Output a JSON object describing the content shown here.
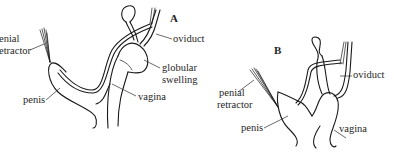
{
  "figure": {
    "panels": [
      {
        "id": "A",
        "letter": "A",
        "labels": {
          "penial_retractor_line1": "enial",
          "penial_retractor_line2": "etractor",
          "oviduct": "oviduct",
          "globular_swelling_line1": "globular",
          "globular_swelling_line2": "swelling",
          "vagina": "vagina",
          "penis": "penis"
        }
      },
      {
        "id": "B",
        "letter": "B",
        "labels": {
          "penial_retractor_line1": "penial",
          "penial_retractor_line2": "retractor",
          "oviduct": "oviduct",
          "penis": "penis",
          "vagina": "vagina"
        }
      }
    ]
  }
}
